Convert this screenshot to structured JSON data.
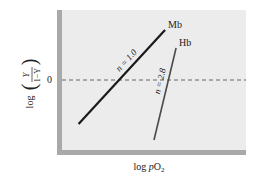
{
  "chart_data": {
    "type": "line",
    "title": "",
    "xlabel": "log pO₂",
    "xlabel_parts": {
      "prefix": "log ",
      "italic": "p",
      "main": "O",
      "sub": "2"
    },
    "ylabel": "log(Y/(1−Y))",
    "ylabel_parts": {
      "prefix": "log",
      "num": "Y",
      "den": "1−Y"
    },
    "y_ticks": [
      {
        "value": 0,
        "label": "0"
      }
    ],
    "x_ticks": [],
    "xlim": [
      0,
      10
    ],
    "ylim": [
      -3.5,
      3.5
    ],
    "reference_line": {
      "y": 0,
      "style": "dashed"
    },
    "grid": false,
    "series": [
      {
        "name": "Mb",
        "slope_label": "n = 1.0",
        "slope": 1.0,
        "color": "#1a1a1a",
        "points": [
          [
            0.9,
            -2.2
          ],
          [
            5.6,
            2.5
          ]
        ]
      },
      {
        "name": "Hb",
        "slope_label": "n = 2.8",
        "slope": 2.8,
        "color": "#4a4a4a",
        "points": [
          [
            5.0,
            -3.0
          ],
          [
            6.2,
            1.6
          ]
        ]
      }
    ]
  }
}
